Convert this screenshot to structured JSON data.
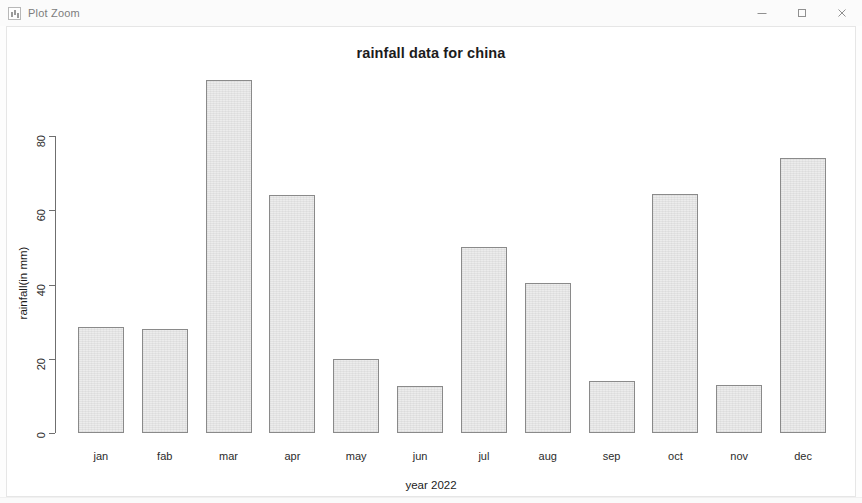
{
  "window": {
    "title": "Plot Zoom",
    "app_icon": "plot-window-icon",
    "controls": {
      "minimize": "–",
      "maximize": "□",
      "close": "×"
    }
  },
  "chart_data": {
    "type": "bar",
    "title": "rainfall data for china",
    "xlabel": "year 2022",
    "ylabel": "rainfall(in mm)",
    "categories": [
      "jan",
      "fab",
      "mar",
      "apr",
      "may",
      "jun",
      "jul",
      "aug",
      "sep",
      "oct",
      "nov",
      "dec"
    ],
    "values": [
      28.5,
      28,
      95,
      64,
      20,
      12.7,
      50,
      40.5,
      14,
      64.5,
      12.8,
      74
    ],
    "ylim": [
      0,
      95
    ],
    "yticks": [
      "0",
      "20",
      "40",
      "60",
      "80"
    ],
    "ytick_values": [
      0,
      20,
      40,
      60,
      80
    ],
    "grid": false,
    "legend": null,
    "bar_fill": "#ececec",
    "bar_border": "#8a8a8a",
    "axis_color": "#6f6f6f"
  }
}
